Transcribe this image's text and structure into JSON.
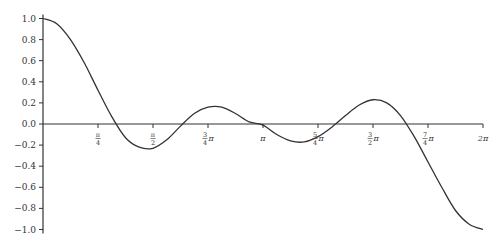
{
  "chart_data": {
    "type": "line",
    "title": "",
    "xlabel": "",
    "ylabel": "",
    "xlim": [
      0,
      6.283185
    ],
    "ylim": [
      -1.0,
      1.0
    ],
    "grid": false,
    "legend": null,
    "x_ticks": [
      {
        "value_pi": 0.25,
        "num": "π",
        "den": "4",
        "suffix": ""
      },
      {
        "value_pi": 0.5,
        "num": "π",
        "den": "2",
        "suffix": ""
      },
      {
        "value_pi": 0.75,
        "num": "3",
        "den": "4",
        "suffix": "π"
      },
      {
        "value_pi": 1.0,
        "num": "",
        "den": "",
        "suffix": "π"
      },
      {
        "value_pi": 1.25,
        "num": "5",
        "den": "4",
        "suffix": "π"
      },
      {
        "value_pi": 1.5,
        "num": "3",
        "den": "2",
        "suffix": "π"
      },
      {
        "value_pi": 1.75,
        "num": "7",
        "den": "4",
        "suffix": "π"
      },
      {
        "value_pi": 2.0,
        "num": "",
        "den": "",
        "suffix": "2π"
      }
    ],
    "y_ticks": [
      "1.0",
      "0.8",
      "0.6",
      "0.4",
      "0.2",
      "0.0",
      "−0.2",
      "−0.4",
      "−0.6",
      "−0.8",
      "−1.0"
    ],
    "y_tick_values": [
      1.0,
      0.8,
      0.6,
      0.4,
      0.2,
      0.0,
      -0.2,
      -0.4,
      -0.6,
      -0.8,
      -1.0
    ],
    "series": [
      {
        "name": "f(x)",
        "color": "#333333",
        "x_over_pi": [
          0,
          0.0625,
          0.125,
          0.1875,
          0.25,
          0.3125,
          0.375,
          0.4375,
          0.5,
          0.5625,
          0.625,
          0.6875,
          0.75,
          0.8125,
          0.875,
          0.9375,
          1.0,
          1.0625,
          1.125,
          1.1875,
          1.25,
          1.3125,
          1.375,
          1.4375,
          1.5,
          1.5625,
          1.625,
          1.6875,
          1.75,
          1.8125,
          1.875,
          1.9375,
          2.0
        ],
        "y": [
          1.0,
          0.95,
          0.8,
          0.58,
          0.32,
          0.07,
          -0.13,
          -0.22,
          -0.23,
          -0.15,
          -0.02,
          0.1,
          0.16,
          0.16,
          0.1,
          0.02,
          -0.01,
          -0.1,
          -0.16,
          -0.17,
          -0.12,
          -0.03,
          0.08,
          0.18,
          0.23,
          0.2,
          0.08,
          -0.12,
          -0.36,
          -0.6,
          -0.82,
          -0.95,
          -1.0
        ]
      }
    ]
  }
}
